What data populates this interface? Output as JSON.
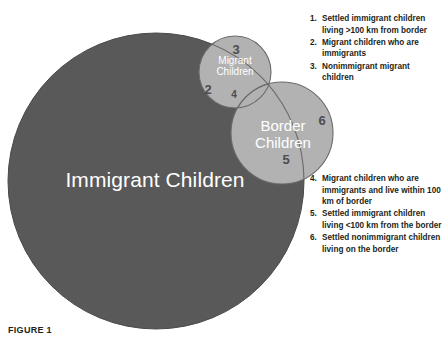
{
  "figure": {
    "caption": "FIGURE 1"
  },
  "diagram": {
    "type": "venn",
    "sets": [
      {
        "id": "immigrant-children",
        "label": "Immigrant Children",
        "fill": "#595959",
        "text_color": "#ffffff"
      },
      {
        "id": "migrant-children",
        "label": "Migrant\nChildren",
        "fill": "#b2b2b2",
        "text_color": "#ffffff"
      },
      {
        "id": "border-children",
        "label": "Border\nChildren",
        "fill": "#b2b2b2",
        "text_color": "#ffffff"
      }
    ],
    "region_numbers": {
      "two": "2",
      "three": "3",
      "four": "4",
      "five": "5",
      "six": "6"
    }
  },
  "legend": {
    "top": [
      {
        "num": "1.",
        "text": "Settled immigrant children living >100 km from border"
      },
      {
        "num": "2.",
        "text": "Migrant children who are immigrants"
      },
      {
        "num": "3.",
        "text": "Nonimmigrant migrant children"
      }
    ],
    "bottom": [
      {
        "num": "4.",
        "text": "Migrant children who are immigrants and live within 100 km of border"
      },
      {
        "num": "5.",
        "text": "Settled immigrant children living <100 km from the border"
      },
      {
        "num": "6.",
        "text": "Settled nonimmigrant children living on the border"
      }
    ]
  }
}
